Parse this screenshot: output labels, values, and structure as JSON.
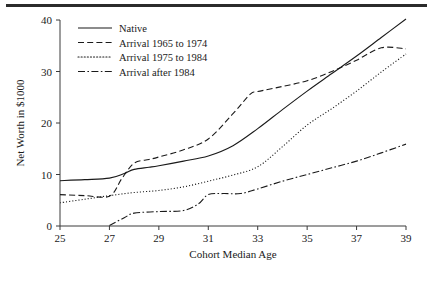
{
  "chart_data": {
    "type": "line",
    "title": "",
    "xlabel": "Cohort Median Age",
    "ylabel": "Net Worth in $1000",
    "xlim": [
      25,
      39
    ],
    "ylim": [
      0,
      40
    ],
    "xticks": [
      25,
      27,
      29,
      31,
      33,
      35,
      37,
      39
    ],
    "yticks": [
      0,
      10,
      20,
      30,
      40
    ],
    "grid": false,
    "legend_position": "top-left",
    "series": [
      {
        "name": "Native",
        "style": "solid",
        "x": [
          25,
          26,
          27,
          27.6,
          28,
          28.6,
          29,
          30,
          31,
          32,
          33,
          34,
          35,
          36,
          37,
          38,
          39
        ],
        "values": [
          8.8,
          9.0,
          9.3,
          10.2,
          11.0,
          11.4,
          11.7,
          12.6,
          13.6,
          15.6,
          18.9,
          22.6,
          26.2,
          29.6,
          33.0,
          36.6,
          40.2
        ]
      },
      {
        "name": "Arrival 1965 to 1974",
        "style": "dashed",
        "x": [
          25,
          26,
          27,
          27.5,
          28,
          28.6,
          29,
          30,
          31,
          32,
          32.7,
          33,
          34,
          35,
          36,
          37,
          38,
          39
        ],
        "values": [
          6.1,
          5.9,
          5.8,
          9.2,
          12.2,
          12.9,
          13.4,
          14.8,
          16.9,
          21.8,
          25.6,
          26.1,
          27.1,
          28.2,
          30.0,
          32.2,
          34.6,
          34.4
        ]
      },
      {
        "name": "Arrival 1975 to 1984",
        "style": "dotted",
        "x": [
          25,
          26,
          27,
          28,
          29,
          30,
          31,
          32,
          33,
          34,
          35,
          36,
          37,
          38,
          39
        ],
        "values": [
          4.5,
          5.2,
          5.9,
          6.5,
          6.9,
          7.6,
          8.7,
          9.9,
          11.5,
          15.4,
          19.6,
          22.8,
          26.2,
          29.9,
          33.4
        ]
      },
      {
        "name": "Arrival after 1984",
        "style": "dash-dot",
        "x": [
          27,
          27.6,
          28,
          29,
          30,
          30.6,
          31,
          31.6,
          32.3,
          33,
          34,
          35,
          36,
          37,
          38,
          39
        ],
        "values": [
          0.1,
          1.6,
          2.5,
          2.8,
          3.0,
          4.3,
          6.1,
          6.3,
          6.3,
          7.2,
          8.7,
          10.0,
          11.3,
          12.6,
          14.2,
          15.9
        ]
      }
    ]
  },
  "legend": {
    "entries": [
      {
        "label": "Native"
      },
      {
        "label": "Arrival 1965 to 1974"
      },
      {
        "label": "Arrival 1975 to 1984"
      },
      {
        "label": "Arrival after 1984"
      }
    ]
  },
  "axes": {
    "x_title": "Cohort Median Age",
    "y_title": "Net Worth in $1000",
    "x_tick_labels": [
      "25",
      "27",
      "29",
      "31",
      "33",
      "35",
      "37",
      "39"
    ],
    "y_tick_labels": [
      "0",
      "10",
      "20",
      "30",
      "40"
    ]
  },
  "colors": {
    "ink": "#1a1a1a",
    "axis": "#3a3a3a",
    "rule": "#2b2b2b",
    "background": "#ffffff"
  }
}
